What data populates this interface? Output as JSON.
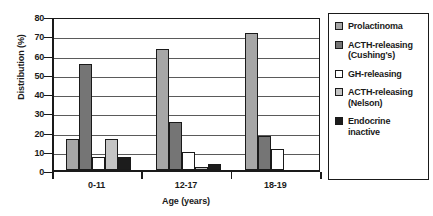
{
  "chart_data": {
    "type": "bar",
    "title": "",
    "xlabel": "Age (years)",
    "ylabel": "Distribution (%)",
    "categories": [
      "0-11",
      "12-17",
      "18-19"
    ],
    "ylim": [
      0,
      80
    ],
    "yticks": [
      0,
      10,
      20,
      30,
      40,
      50,
      60,
      70,
      80
    ],
    "grid": true,
    "legend_position": "right",
    "series": [
      {
        "name": "Prolactinoma",
        "color": "#a6a6a6",
        "values": [
          16,
          63,
          71
        ]
      },
      {
        "name": "ACTH-releasing\n(Cushing's)",
        "color": "#757575",
        "values": [
          55,
          25,
          17.5
        ]
      },
      {
        "name": "GH-releasing",
        "color": "#ffffff",
        "values": [
          7,
          9.5,
          11
        ]
      },
      {
        "name": "ACTH-releasing\n(Nelson)",
        "color": "#c4c4c4",
        "values": [
          16,
          1.5,
          0
        ]
      },
      {
        "name": "Endocrine\ninactive",
        "color": "#1c1c1c",
        "values": [
          7,
          3,
          0
        ]
      }
    ]
  }
}
